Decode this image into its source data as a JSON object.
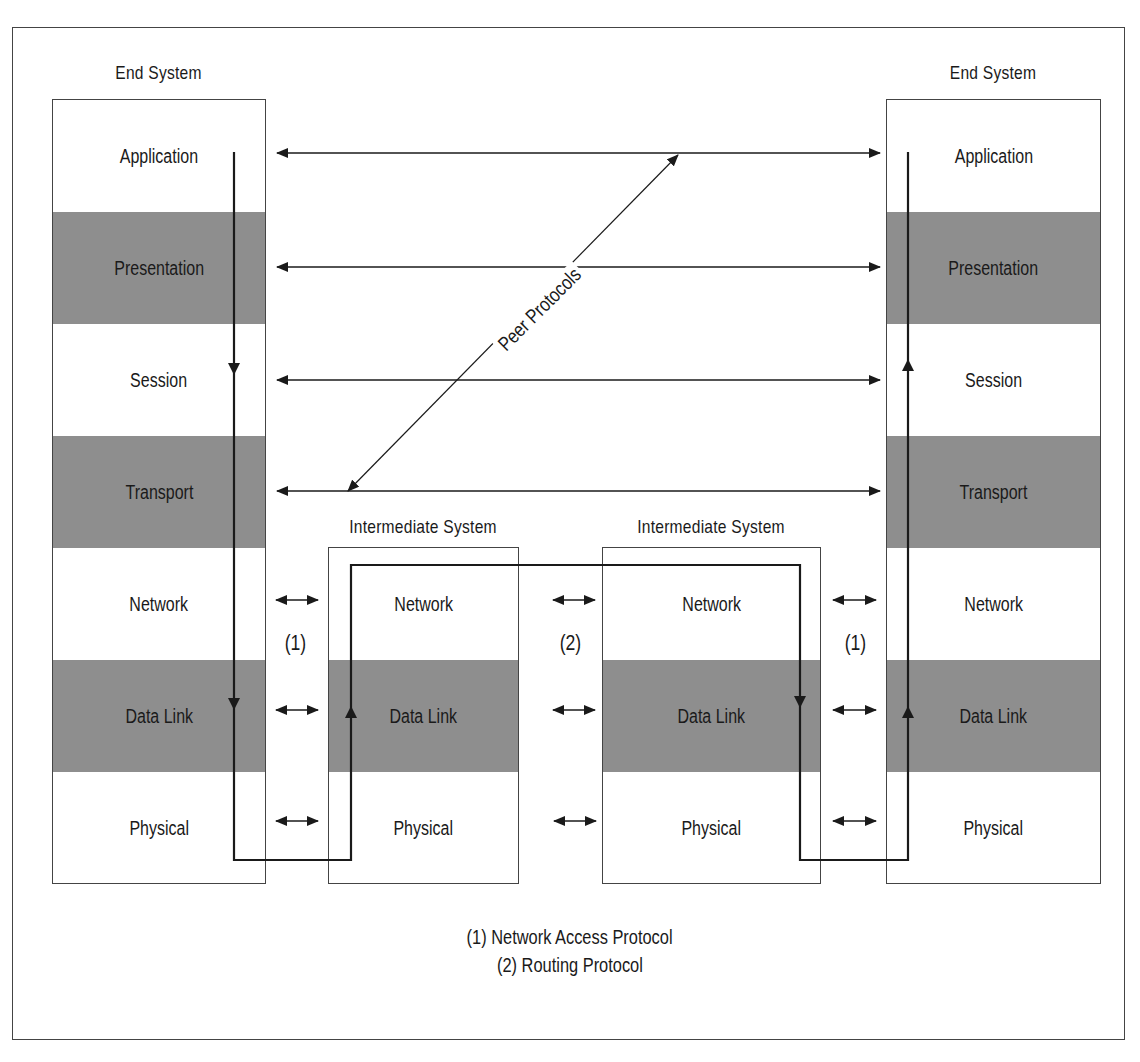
{
  "diagram": {
    "type": "OSI reference model communication path",
    "systems": [
      {
        "id": "end-system-left",
        "title": "End System",
        "layers": [
          {
            "name": "Application",
            "shaded": false
          },
          {
            "name": "Presentation",
            "shaded": true
          },
          {
            "name": "Session",
            "shaded": false
          },
          {
            "name": "Transport",
            "shaded": true
          },
          {
            "name": "Network",
            "shaded": false
          },
          {
            "name": "Data Link",
            "shaded": true
          },
          {
            "name": "Physical",
            "shaded": false
          }
        ]
      },
      {
        "id": "intermediate-system-1",
        "title": "Intermediate System",
        "layers": [
          {
            "name": "Network",
            "shaded": false
          },
          {
            "name": "Data Link",
            "shaded": true
          },
          {
            "name": "Physical",
            "shaded": false
          }
        ]
      },
      {
        "id": "intermediate-system-2",
        "title": "Intermediate System",
        "layers": [
          {
            "name": "Network",
            "shaded": false
          },
          {
            "name": "Data Link",
            "shaded": true
          },
          {
            "name": "Physical",
            "shaded": false
          }
        ]
      },
      {
        "id": "end-system-right",
        "title": "End System",
        "layers": [
          {
            "name": "Application",
            "shaded": false
          },
          {
            "name": "Presentation",
            "shaded": true
          },
          {
            "name": "Session",
            "shaded": false
          },
          {
            "name": "Transport",
            "shaded": true
          },
          {
            "name": "Network",
            "shaded": false
          },
          {
            "name": "Data Link",
            "shaded": true
          },
          {
            "name": "Physical",
            "shaded": false
          }
        ]
      }
    ],
    "peer_protocols_label": "Peer Protocols",
    "link_markers": [
      "(1)",
      "(2)",
      "(1)"
    ],
    "legend": [
      "(1) Network Access Protocol",
      "(2) Routing Protocol"
    ],
    "colors": {
      "shaded_layer": "#8e8e8e",
      "line": "#1a1a1a",
      "border": "#444444"
    }
  }
}
